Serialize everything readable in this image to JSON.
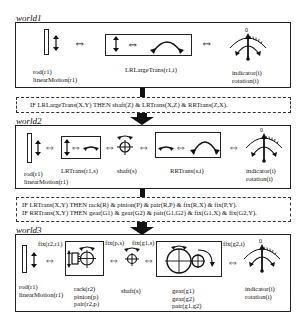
{
  "worlds": [
    {
      "label": "world1",
      "components": {
        "rod": {
          "lines": [
            "rod(r1)",
            "linearMotion(r1)"
          ]
        },
        "transform": {
          "label": "LRLargeTrans(r1,i)"
        },
        "indicator": {
          "zero": "0",
          "lines": [
            "indicator(i)",
            "rotation(i)"
          ]
        }
      }
    },
    {
      "label": "world2",
      "components": {
        "rod": {
          "lines": [
            "rod(r1)",
            "linearMotion(r1)"
          ]
        },
        "lrtrans": {
          "label": "LRTrans(r1,s)"
        },
        "shaft": {
          "label": "shaft(s)"
        },
        "rrtrans": {
          "label": "RRTrans(s,i)"
        },
        "indicator": {
          "zero": "0",
          "lines": [
            "indicator(i)",
            "rotation(i)"
          ]
        }
      }
    },
    {
      "label": "world3",
      "components": {
        "rod": {
          "lines": [
            "rod(r1)",
            "linearMotion(r1)"
          ]
        },
        "fix_r2_r1": "fix(r2,r1)",
        "rack_pinion": {
          "lines": [
            "rack(r2)",
            "pinion(p)",
            "pair(r2,p)"
          ]
        },
        "fix_p_s": "fix(p,s)",
        "fix_g1_s": "fix(g1,s)",
        "shaft": {
          "label": "shaft(s)"
        },
        "gears": {
          "lines": [
            "gear(g1)",
            "gear(g2)",
            "pair(g1,g2)"
          ]
        },
        "fix_g2_i": "fix(g2,i)",
        "indicator": {
          "zero": "0",
          "lines": [
            "indicator(i)",
            "rotation(i)"
          ]
        }
      }
    }
  ],
  "rules": [
    {
      "lines": [
        "IF LRLargeTrans(X,Y) THEN shaft(Z) & LRTrans(X,Z) & RRTrans(Z,X)."
      ]
    },
    {
      "lines": [
        "IF LRTrans(X,Y) THEN rack(R) & pinion(P) & pair(R,P) & fix(R,X) & fix(P,Y).",
        "IF RRTrans(X,Y) THEN gear(G1) & gear(G2) & pair(G1,G2) & fix(G1,X) & fix(G2,Y)."
      ]
    }
  ],
  "symbols": {
    "equivalence": "⇔"
  }
}
